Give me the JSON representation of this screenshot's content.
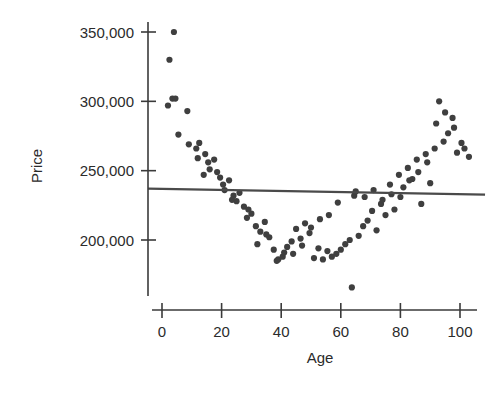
{
  "chart_data": {
    "type": "scatter",
    "title": "",
    "xlabel": "Age",
    "ylabel": "Price",
    "xlim": [
      -8,
      110
    ],
    "ylim": [
      160000,
      358000
    ],
    "xticks": [
      0,
      20,
      40,
      60,
      80,
      100
    ],
    "xtick_labels": [
      "0",
      "20",
      "40",
      "60",
      "80",
      "100"
    ],
    "yticks": [
      200000,
      250000,
      300000,
      350000
    ],
    "ytick_labels": [
      "200,000",
      "250,000",
      "300,000",
      "350,000"
    ],
    "grid": false,
    "legend": false,
    "marker_color": "#3f3f3f",
    "marker_size": 5,
    "series": [
      {
        "name": "observations",
        "x": [
          4.0,
          2.5,
          3.5,
          4.5,
          2.0,
          8.5,
          5.5,
          9.0,
          11.5,
          12.5,
          14.5,
          12.0,
          15.5,
          17.5,
          16.0,
          18.5,
          19.5,
          14.0,
          20.5,
          22.5,
          21.0,
          24.0,
          23.5,
          26.0,
          27.5,
          25.0,
          28.5,
          30.0,
          31.5,
          29.0,
          33.0,
          34.5,
          32.0,
          36.0,
          37.5,
          35.0,
          39.0,
          40.5,
          38.5,
          42.0,
          43.5,
          41.0,
          45.0,
          46.5,
          44.0,
          48.0,
          49.5,
          47.0,
          51.0,
          52.5,
          50.0,
          54.0,
          55.5,
          53.0,
          57.0,
          58.5,
          56.0,
          60.0,
          61.5,
          59.0,
          63.0,
          63.7,
          64.5,
          66.0,
          67.5,
          65.0,
          69.0,
          70.5,
          68.0,
          72.0,
          73.5,
          71.0,
          75.0,
          76.5,
          74.0,
          78.0,
          79.5,
          77.0,
          81.0,
          82.5,
          80.0,
          84.0,
          85.5,
          83.0,
          87.0,
          88.5,
          86.0,
          90.0,
          91.5,
          89.0,
          93.0,
          94.5,
          92.0,
          96.0,
          97.5,
          95.0,
          99.0,
          100.5,
          98.0,
          101.5,
          103.0
        ],
        "y": [
          350000,
          330000,
          302000,
          302000,
          297000,
          293000,
          276000,
          269000,
          266000,
          270000,
          262000,
          259000,
          256000,
          258000,
          251000,
          249000,
          245000,
          247000,
          240000,
          243000,
          236000,
          232000,
          229000,
          234000,
          224000,
          228000,
          216000,
          219000,
          210000,
          222000,
          206000,
          213000,
          197000,
          202000,
          193000,
          204000,
          186000,
          188000,
          185000,
          195000,
          199000,
          191000,
          208000,
          201000,
          190000,
          212000,
          205000,
          196000,
          187000,
          194000,
          209000,
          186000,
          192000,
          215000,
          188000,
          190000,
          218000,
          193000,
          197000,
          227000,
          200000,
          165800,
          232000,
          203000,
          210000,
          235000,
          214000,
          221000,
          231000,
          207000,
          226000,
          236000,
          218000,
          240000,
          229000,
          222000,
          247000,
          233000,
          238000,
          252000,
          231000,
          244000,
          258000,
          243000,
          226000,
          262000,
          249000,
          241000,
          266000,
          256000,
          300000,
          271000,
          284000,
          277000,
          288000,
          292000,
          263000,
          270000,
          281000,
          266000,
          260000
        ]
      }
    ],
    "trend_line": {
      "name": "least-squares fit",
      "color": "#4a4a4a",
      "x_start": -4.7,
      "y_start": 237100,
      "x_end": 108.4,
      "y_end": 232700
    }
  }
}
